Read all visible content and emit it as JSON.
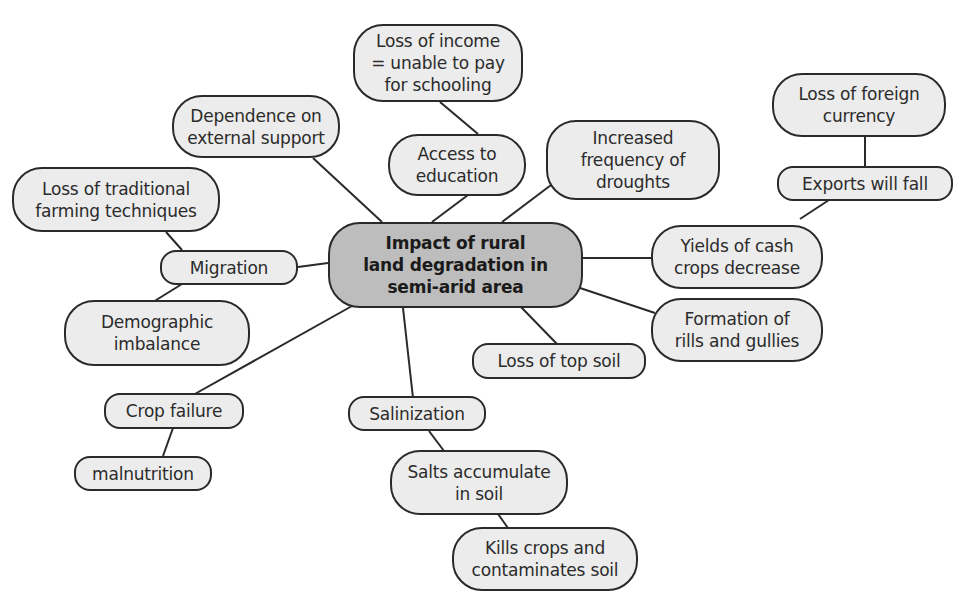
{
  "diagram": {
    "type": "mind-map",
    "center": {
      "label": "Impact of rural\nland degradation in\nsemi-arid area"
    },
    "nodes": {
      "loss_income": {
        "label": "Loss of income\n= unable to pay\nfor schooling"
      },
      "access_education": {
        "label": "Access to\neducation"
      },
      "dependence": {
        "label": "Dependence on\nexternal support"
      },
      "droughts": {
        "label": "Increased\nfrequency of\ndroughts"
      },
      "foreign_currency": {
        "label": "Loss of foreign\ncurrency"
      },
      "exports_fall": {
        "label": "Exports will fall"
      },
      "cash_crops": {
        "label": "Yields of cash\ncrops decrease"
      },
      "rills_gullies": {
        "label": "Formation of\nrills and gullies"
      },
      "top_soil": {
        "label": "Loss of top soil"
      },
      "traditional_farming": {
        "label": "Loss of traditional\nfarming techniques"
      },
      "migration": {
        "label": "Migration"
      },
      "demographic": {
        "label": "Demographic\nimbalance"
      },
      "crop_failure": {
        "label": "Crop failure"
      },
      "malnutrition": {
        "label": "malnutrition"
      },
      "salinization": {
        "label": "Salinization"
      },
      "salts_accumulate": {
        "label": "Salts accumulate\nin soil"
      },
      "kills_crops": {
        "label": "Kills crops and\ncontaminates soil"
      }
    },
    "edges": [
      [
        "center",
        "dependence"
      ],
      [
        "center",
        "access_education"
      ],
      [
        "access_education",
        "loss_income"
      ],
      [
        "center",
        "droughts"
      ],
      [
        "center",
        "cash_crops"
      ],
      [
        "cash_crops",
        "exports_fall"
      ],
      [
        "exports_fall",
        "foreign_currency"
      ],
      [
        "center",
        "rills_gullies"
      ],
      [
        "center",
        "top_soil"
      ],
      [
        "center",
        "migration"
      ],
      [
        "migration",
        "traditional_farming"
      ],
      [
        "migration",
        "demographic"
      ],
      [
        "center",
        "crop_failure"
      ],
      [
        "crop_failure",
        "malnutrition"
      ],
      [
        "center",
        "salinization"
      ],
      [
        "salinization",
        "salts_accumulate"
      ],
      [
        "salts_accumulate",
        "kills_crops"
      ]
    ],
    "colors": {
      "node_fill": "#ececec",
      "center_fill": "#bdbdbd",
      "stroke": "#2a2a2a"
    }
  }
}
